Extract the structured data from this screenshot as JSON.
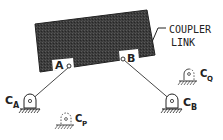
{
  "diagram": {
    "type": "four-bar linkage schematic",
    "colors": {
      "ink": "#222222",
      "coupler_fill": "#3a3a3a",
      "background": "#ffffff"
    },
    "coupler": {
      "label_line1": "COUPLER",
      "label_line2": "LINK"
    },
    "joints": {
      "A": {
        "label": "A"
      },
      "B": {
        "label": "B"
      }
    },
    "pivots": {
      "CA": {
        "main": "C",
        "sub": "A",
        "style": "solid"
      },
      "CB": {
        "main": "C",
        "sub": "B",
        "style": "solid"
      },
      "CP": {
        "main": "C",
        "sub": "P",
        "style": "dashed"
      },
      "CQ": {
        "main": "C",
        "sub": "Q",
        "style": "partially-dashed"
      }
    }
  }
}
